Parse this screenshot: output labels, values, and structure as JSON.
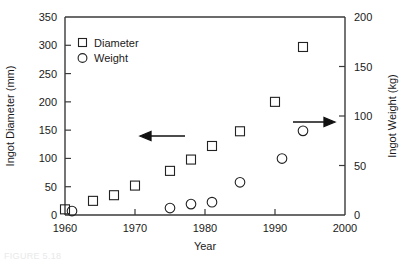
{
  "chart_data": {
    "type": "scatter",
    "title": "",
    "xlabel": "Year",
    "ylabel": "Ingot Diameter (mm)",
    "y2label": "Ingot Weight (kg)",
    "xlim": [
      1960,
      2000
    ],
    "ylim": [
      0,
      350
    ],
    "y2lim": [
      0,
      200
    ],
    "xticks": [
      1960,
      1970,
      1980,
      1990,
      2000
    ],
    "xticklabels": [
      "1960",
      "1970",
      "1980",
      "1990",
      "2000"
    ],
    "yticks": [
      0,
      50,
      100,
      150,
      200,
      250,
      300,
      350
    ],
    "yticklabels": [
      "0",
      "50",
      "100",
      "150",
      "200",
      "250",
      "300",
      "350"
    ],
    "y2ticks": [
      0,
      50,
      100,
      150,
      200
    ],
    "y2ticklabels": [
      "0",
      "50",
      "100",
      "150",
      "200"
    ],
    "grid": false,
    "legend_position": "upper-left-inside",
    "series": [
      {
        "name": "Diameter",
        "marker": "square",
        "axis": "left",
        "points": [
          {
            "x": 1960,
            "y": 10
          },
          {
            "x": 1964,
            "y": 25
          },
          {
            "x": 1967,
            "y": 35
          },
          {
            "x": 1970,
            "y": 52
          },
          {
            "x": 1975,
            "y": 78
          },
          {
            "x": 1978,
            "y": 98
          },
          {
            "x": 1981,
            "y": 122
          },
          {
            "x": 1985,
            "y": 148
          },
          {
            "x": 1990,
            "y": 200
          },
          {
            "x": 1994,
            "y": 297
          }
        ]
      },
      {
        "name": "Weight",
        "marker": "circle",
        "axis": "right",
        "points": [
          {
            "x": 1961,
            "y": 4
          },
          {
            "x": 1975,
            "y": 7
          },
          {
            "x": 1978,
            "y": 11
          },
          {
            "x": 1981,
            "y": 13
          },
          {
            "x": 1985,
            "y": 33
          },
          {
            "x": 1991,
            "y": 57
          },
          {
            "x": 1994,
            "y": 85
          }
        ]
      }
    ],
    "annotations": [
      {
        "name": "left-axis-arrow",
        "text": "",
        "direction": "left",
        "points_to": "left-y-axis"
      },
      {
        "name": "right-axis-arrow",
        "text": "",
        "direction": "right",
        "points_to": "right-y-axis"
      }
    ]
  },
  "legend": {
    "items": [
      {
        "label": "Diameter",
        "marker": "square"
      },
      {
        "label": "Weight",
        "marker": "circle"
      }
    ]
  },
  "axes": {
    "x_title": "Year",
    "y_left_title": "Ingot Diameter (mm)",
    "y_right_title": "Ingot Weight (kg)"
  },
  "colors": {
    "axis": "#3a3a3a",
    "marker": "#222222",
    "text": "#1a1a1a",
    "background": "#ffffff"
  },
  "caption": {
    "text": "FIGURE 5.18"
  }
}
